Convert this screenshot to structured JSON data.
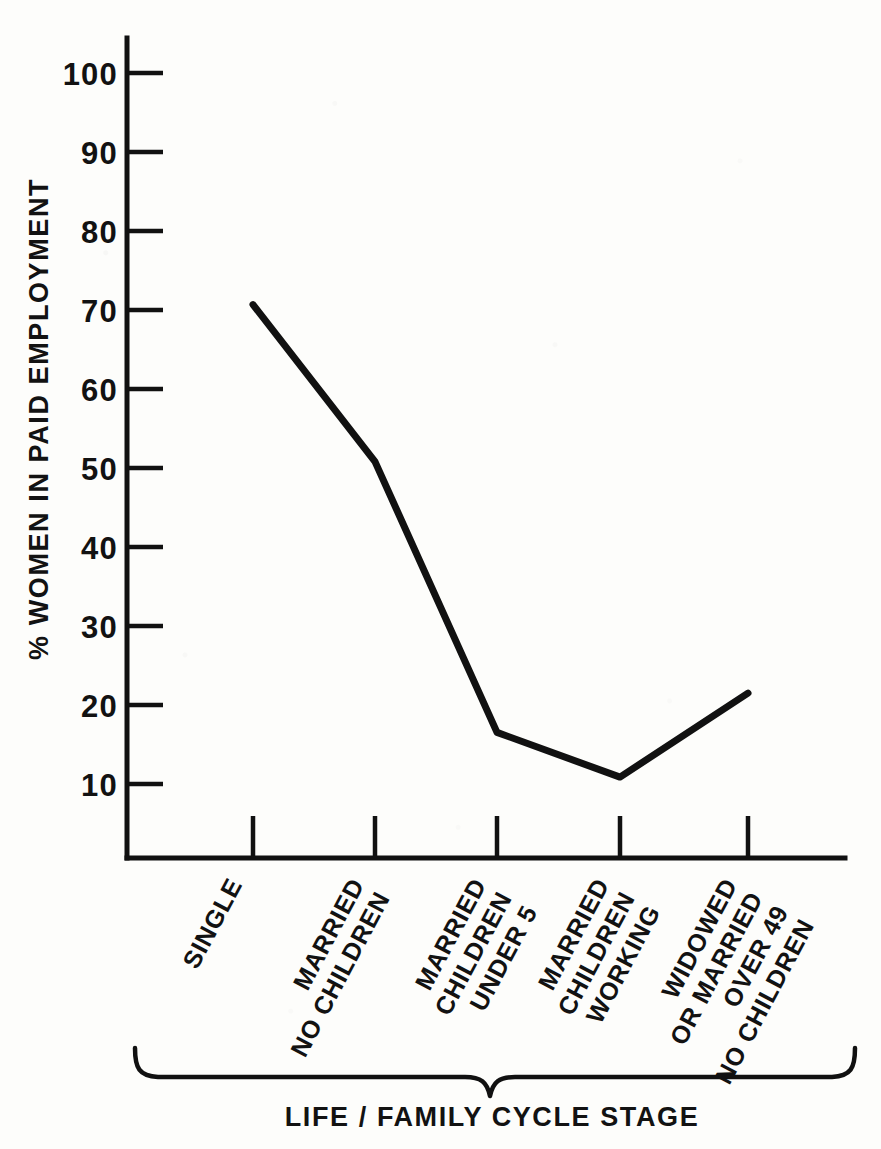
{
  "chart_data": {
    "type": "line",
    "title": "",
    "subtitle": "",
    "xlabel": "LIFE / FAMILY CYCLE STAGE",
    "ylabel": "% WOMEN IN PAID EMPLOYMENT",
    "categories": [
      "SINGLE",
      "MARRIED NO CHILDREN",
      "MARRIED CHILDREN UNDER 5",
      "MARRIED CHILDREN WORKING",
      "WIDOWED OR MARRIED OVER 49 NO CHILDREN"
    ],
    "category_lines": [
      [
        "SINGLE"
      ],
      [
        "MARRIED",
        "NO CHILDREN"
      ],
      [
        "MARRIED",
        "CHILDREN",
        "UNDER 5"
      ],
      [
        "MARRIED",
        "CHILDREN",
        "WORKING"
      ],
      [
        "WIDOWED",
        "OR MARRIED",
        "OVER 49",
        "NO CHILDREN"
      ]
    ],
    "values": [
      70.5,
      50.5,
      16,
      10.3,
      21
    ],
    "ylim": [
      0,
      105
    ],
    "ytick_labels": [
      "10",
      "20",
      "30",
      "40",
      "50",
      "60",
      "70",
      "80",
      "90",
      "100"
    ],
    "ytick_values": [
      10,
      20,
      30,
      40,
      50,
      60,
      70,
      80,
      90,
      100
    ],
    "grid": false,
    "legend": false,
    "legend_position": "none",
    "line_color": "#111111",
    "background_color": "#fdfdfb"
  },
  "axes": {
    "y_title": "% WOMEN IN PAID EMPLOYMENT",
    "x_title": "LIFE / FAMILY CYCLE STAGE"
  },
  "colors": {
    "ink": "#111111",
    "paper": "#fdfdfb"
  }
}
